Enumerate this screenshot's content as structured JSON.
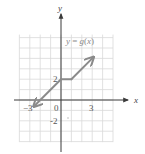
{
  "chart_data": {
    "type": "line",
    "title": "",
    "xlabel": "x",
    "ylabel": "y",
    "xlim": [
      -4,
      5
    ],
    "ylim": [
      -4,
      6
    ],
    "grid": true,
    "x_ticks": [
      {
        "value": -3,
        "label": "−3"
      },
      {
        "value": 0,
        "label": "0"
      },
      {
        "value": 3,
        "label": "3"
      }
    ],
    "y_ticks": [
      {
        "value": 2,
        "label": "2"
      },
      {
        "value": -2,
        "label": "-2"
      }
    ],
    "series": [
      {
        "name": "y = g(x)",
        "label_parts": {
          "y": "y",
          "eq": " = ",
          "g": "g",
          "open": "(",
          "x": "x",
          "close": ")"
        },
        "pieces": [
          {
            "formula": "y = x + 2",
            "domain": "x ≤ 0",
            "points": [
              [
                -2.5,
                -0.5
              ],
              [
                0,
                2
              ]
            ],
            "arrow_start": true
          },
          {
            "formula": "y = 2",
            "domain": "0 ≤ x ≤ 1",
            "points": [
              [
                0,
                2
              ],
              [
                1,
                2
              ]
            ]
          },
          {
            "formula": "y = x + 1",
            "domain": "x ≥ 1",
            "points": [
              [
                1,
                2
              ],
              [
                3,
                4
              ]
            ],
            "arrow_end": true
          }
        ],
        "color": "#8a8a8a"
      }
    ],
    "colors": {
      "grid": "#d9d9d9",
      "axes": "#3a3a3a",
      "curve": "#8a8a8a"
    }
  }
}
